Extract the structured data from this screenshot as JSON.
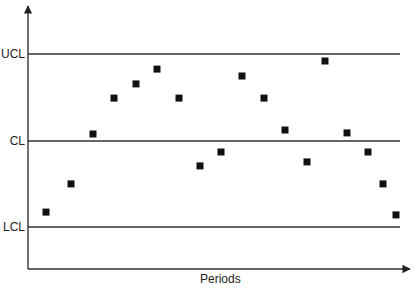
{
  "chart_data": {
    "type": "scatter",
    "title": "",
    "xlabel": "Periods",
    "ylabel": "",
    "grid": false,
    "legend": null,
    "control_limits": [
      {
        "name": "UCL",
        "value": 3
      },
      {
        "name": "CL",
        "value": 0
      },
      {
        "name": "LCL",
        "value": -3
      }
    ],
    "ytick_labels": [
      "UCL",
      "CL",
      "LCL"
    ],
    "ylim": [
      -4.45,
      4.7
    ],
    "x": [
      1,
      2,
      3,
      4,
      5,
      6,
      7,
      8,
      9,
      10,
      11,
      12,
      13,
      14,
      15,
      16,
      17,
      18
    ],
    "x_pixel": [
      46,
      71,
      93,
      114,
      136,
      157,
      179,
      200,
      221,
      242,
      264,
      285,
      307,
      325,
      347,
      368,
      383,
      396
    ],
    "series": [
      {
        "name": "Sample",
        "marker": "square",
        "color": "#111111",
        "values": [
          -2.45,
          -1.48,
          0.24,
          1.48,
          1.97,
          2.48,
          1.48,
          -0.86,
          -0.38,
          2.24,
          1.48,
          0.38,
          -0.72,
          2.76,
          0.28,
          -0.38,
          -1.48,
          -2.55
        ]
      }
    ]
  },
  "labels": {
    "ucl": "UCL",
    "cl": "CL",
    "lcl": "LCL",
    "xaxis": "Periods"
  },
  "colors": {
    "axis": "#333333",
    "limit_line": "#333333",
    "marker": "#111111"
  }
}
